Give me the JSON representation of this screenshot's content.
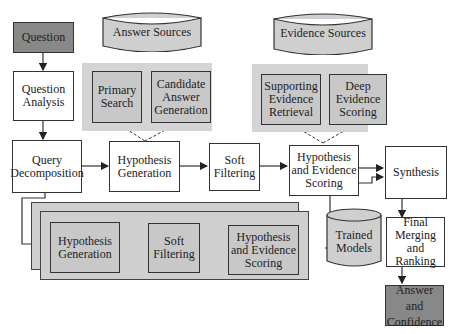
{
  "diagram": {
    "nodes": {
      "question": "Question",
      "question_analysis": "Question Analysis",
      "query_decomposition": "Query Decomposition",
      "answer_sources": "Answer Sources",
      "evidence_sources": "Evidence Sources",
      "primary_search": "Primary Search",
      "candidate_answer_generation": "Candidate Answer Generation",
      "supporting_evidence_retrieval": "Supporting Evidence Retrieval",
      "deep_evidence_scoring": "Deep Evidence Scoring",
      "hypothesis_generation": "Hypothesis Generation",
      "soft_filtering": "Soft Filtering",
      "hypothesis_evidence_scoring": "Hypothesis and Evidence Scoring",
      "synthesis": "Synthesis",
      "trained_models": "Trained Models",
      "final_merging": "Final Merging and Ranking",
      "answer_confidence": "Answer and Confidence",
      "parallel_hypothesis_generation": "Hypothesis Generation",
      "parallel_soft_filtering": "Soft Filtering",
      "parallel_hypothesis_evidence_scoring": "Hypothesis and Evidence Scoring"
    }
  }
}
